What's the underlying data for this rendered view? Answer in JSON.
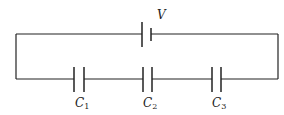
{
  "diagram": {
    "type": "circuit",
    "source": {
      "label": "V",
      "symbol": "battery-cell"
    },
    "capacitors": [
      {
        "label": "C",
        "subscript": "1"
      },
      {
        "label": "C",
        "subscript": "2"
      },
      {
        "label": "C",
        "subscript": "3"
      }
    ],
    "colors": {
      "wire": "#222222",
      "background": "#ffffff"
    }
  }
}
